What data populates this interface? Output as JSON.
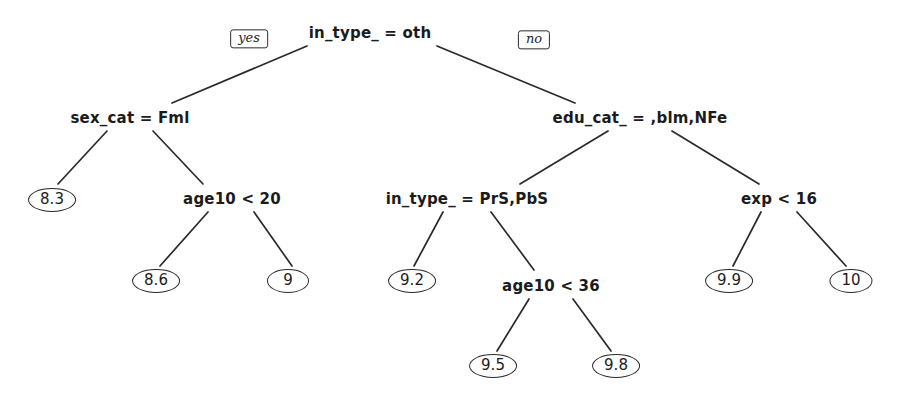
{
  "diagram": {
    "type": "decision-tree",
    "title": "",
    "background_color": "#ffffff",
    "stroke_color": "#2a2a2a",
    "text_color": "#1b1b1b",
    "branch_tags": {
      "yes_label": "yes",
      "no_label": "no"
    },
    "nodes": [
      {
        "id": "n0",
        "kind": "split",
        "label": "in_type_ = oth",
        "x": 370,
        "y": 33
      },
      {
        "id": "n1",
        "kind": "split",
        "label": "sex_cat = Fml",
        "x": 130,
        "y": 118
      },
      {
        "id": "n2",
        "kind": "split",
        "label": "edu_cat_ = ,blm,NFe",
        "x": 640,
        "y": 118
      },
      {
        "id": "n3",
        "kind": "leaf",
        "label": "8.3",
        "x": 52,
        "y": 200
      },
      {
        "id": "n4",
        "kind": "split",
        "label": "age10 < 20",
        "x": 232,
        "y": 199
      },
      {
        "id": "n5",
        "kind": "split",
        "label": "in_type_ = PrS,PbS",
        "x": 467,
        "y": 199
      },
      {
        "id": "n6",
        "kind": "split",
        "label": "exp < 16",
        "x": 779,
        "y": 199
      },
      {
        "id": "n7",
        "kind": "leaf",
        "label": "8.6",
        "x": 156,
        "y": 281
      },
      {
        "id": "n8",
        "kind": "leaf",
        "label": "9",
        "x": 288,
        "y": 281
      },
      {
        "id": "n9",
        "kind": "leaf",
        "label": "9.2",
        "x": 412,
        "y": 281
      },
      {
        "id": "n10",
        "kind": "split",
        "label": "age10 < 36",
        "x": 551,
        "y": 286
      },
      {
        "id": "n11",
        "kind": "leaf",
        "label": "9.9",
        "x": 729,
        "y": 281
      },
      {
        "id": "n12",
        "kind": "leaf",
        "label": "10",
        "x": 851,
        "y": 281
      },
      {
        "id": "n13",
        "kind": "leaf",
        "label": "9.5",
        "x": 493,
        "y": 366
      },
      {
        "id": "n14",
        "kind": "leaf",
        "label": "9.8",
        "x": 616,
        "y": 366
      }
    ],
    "edges": [
      {
        "from": "n0",
        "to": "n1",
        "x1": 307,
        "y1": 46,
        "x2": 172,
        "y2": 103
      },
      {
        "from": "n0",
        "to": "n2",
        "x1": 437,
        "y1": 46,
        "x2": 575,
        "y2": 103
      },
      {
        "from": "n1",
        "to": "n3",
        "x1": 107,
        "y1": 131,
        "x2": 58,
        "y2": 184
      },
      {
        "from": "n1",
        "to": "n4",
        "x1": 153,
        "y1": 131,
        "x2": 203,
        "y2": 184
      },
      {
        "from": "n2",
        "to": "n5",
        "x1": 608,
        "y1": 131,
        "x2": 520,
        "y2": 184
      },
      {
        "from": "n2",
        "to": "n6",
        "x1": 672,
        "y1": 131,
        "x2": 759,
        "y2": 184
      },
      {
        "from": "n4",
        "to": "n7",
        "x1": 208,
        "y1": 212,
        "x2": 160,
        "y2": 266
      },
      {
        "from": "n4",
        "to": "n8",
        "x1": 254,
        "y1": 212,
        "x2": 292,
        "y2": 266
      },
      {
        "from": "n5",
        "to": "n9",
        "x1": 443,
        "y1": 212,
        "x2": 414,
        "y2": 266
      },
      {
        "from": "n5",
        "to": "n10",
        "x1": 491,
        "y1": 212,
        "x2": 534,
        "y2": 270
      },
      {
        "from": "n6",
        "to": "n11",
        "x1": 761,
        "y1": 212,
        "x2": 733,
        "y2": 266
      },
      {
        "from": "n6",
        "to": "n12",
        "x1": 797,
        "y1": 212,
        "x2": 846,
        "y2": 266
      },
      {
        "from": "n10",
        "to": "n13",
        "x1": 529,
        "y1": 299,
        "x2": 497,
        "y2": 351
      },
      {
        "from": "n10",
        "to": "n14",
        "x1": 573,
        "y1": 299,
        "x2": 611,
        "y2": 351
      }
    ],
    "tags": [
      {
        "id": "t-yes",
        "bind": "yes_label",
        "x": 249,
        "y": 39
      },
      {
        "id": "t-no",
        "bind": "no_label",
        "x": 534,
        "y": 40
      }
    ]
  }
}
